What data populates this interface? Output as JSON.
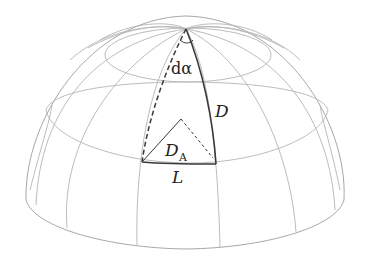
{
  "figure": {
    "labels": {
      "angle": "dα",
      "meridian_distance": "D",
      "angular_diameter_distance_main": "D",
      "angular_diameter_distance_sub": "A",
      "arc_length": "L"
    },
    "colors": {
      "grid": "#b4b4b4",
      "highlight": "#3a3a3a",
      "background": "#ffffff"
    }
  }
}
